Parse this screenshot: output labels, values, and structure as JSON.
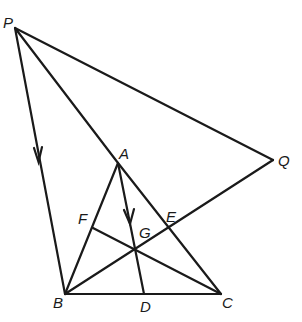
{
  "diagram": {
    "type": "geometry",
    "points": {
      "P": {
        "label": "P",
        "x": 15,
        "y": 28
      },
      "Q": {
        "label": "Q",
        "x": 273,
        "y": 160
      },
      "A": {
        "label": "A",
        "x": 118,
        "y": 163
      },
      "B": {
        "label": "B",
        "x": 65,
        "y": 294
      },
      "C": {
        "label": "C",
        "x": 221,
        "y": 294
      },
      "D": {
        "label": "D",
        "x": 144,
        "y": 294
      },
      "E": {
        "label": "E",
        "x": 171,
        "y": 228
      },
      "F": {
        "label": "F",
        "x": 93,
        "y": 228
      },
      "G": {
        "label": "G",
        "x": 135,
        "y": 248
      }
    },
    "segments": [
      "PQ",
      "PA",
      "PB",
      "AB",
      "AC",
      "BC",
      "AD",
      "BQ",
      "CF"
    ],
    "arrows": [
      "PB",
      "AD"
    ],
    "stroke_color": "#1a1a1a"
  }
}
